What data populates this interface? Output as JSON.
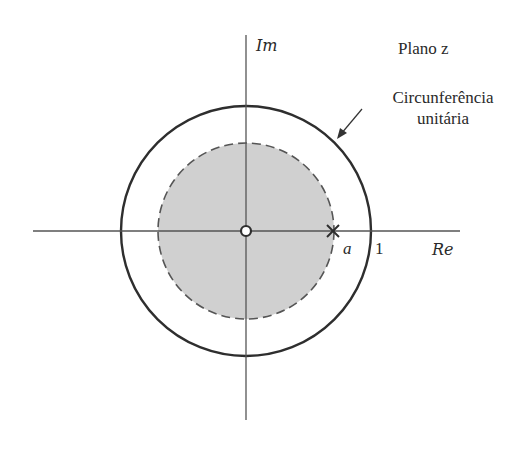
{
  "diagram": {
    "title": "Plano z",
    "axes": {
      "imaginary_label": "Im",
      "real_label": "Re"
    },
    "unit_circle": {
      "label_line1": "Circunferência",
      "label_line2": "unitária",
      "radius_label": "1"
    },
    "pole": {
      "label": "a",
      "marker": "x-marker"
    },
    "zero": {
      "marker": "circle-marker",
      "location": "origin"
    },
    "region_of_convergence": {
      "shape": "disk",
      "boundary": "dashed",
      "fill_color": "#d0d0d0"
    },
    "colors": {
      "line": "#333333",
      "fill": "#d0d0d0",
      "background": "#ffffff"
    }
  }
}
